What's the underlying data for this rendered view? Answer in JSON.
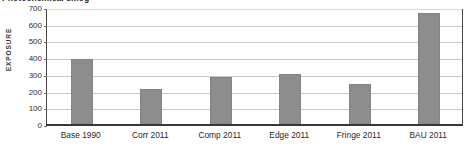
{
  "chart_data": {
    "type": "bar",
    "title": "Photochemical smog",
    "xlabel": "",
    "ylabel": "EXPOSURE",
    "categories": [
      "Base 1990",
      "Corr 2011",
      "Comp 2011",
      "Edge 2011",
      "Fringe 2011",
      "BAU 2011"
    ],
    "values": [
      390,
      210,
      280,
      300,
      240,
      665
    ],
    "ylim": [
      0,
      700
    ],
    "ytick_labels": [
      "0",
      "100",
      "200",
      "300",
      "400",
      "500",
      "600",
      "700"
    ],
    "ytick_values": [
      0,
      100,
      200,
      300,
      400,
      500,
      600,
      700
    ],
    "grid": true,
    "legend": false,
    "series": [
      {
        "name": "Exposure",
        "values": [
          390,
          210,
          280,
          300,
          240,
          665
        ]
      }
    ]
  },
  "style": {
    "bar_color": "#8e8d8d",
    "gridline_color": "#c9c7c7",
    "axis_color": "#3b3738",
    "text_color": "#2b2829",
    "background": "#ffffff"
  }
}
